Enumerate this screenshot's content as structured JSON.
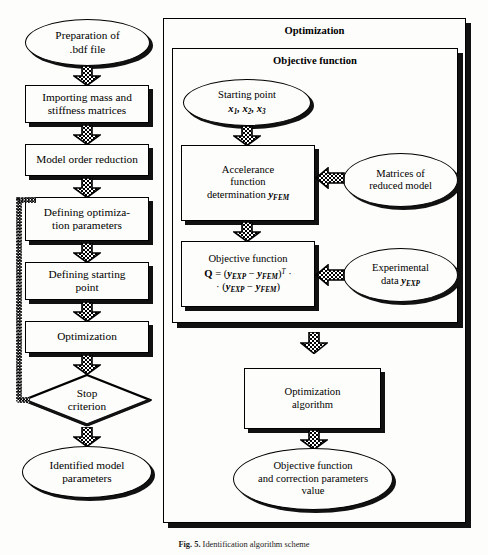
{
  "figure": {
    "caption_label": "Fig. 5.",
    "caption_text": "Identification algorithm scheme"
  },
  "left_column": {
    "nodes": [
      {
        "id": "prep",
        "shape": "ellipse",
        "line1": "Preparation of",
        "line2": ".bdf file"
      },
      {
        "id": "import",
        "shape": "rect",
        "line1": "Importing mass and",
        "line2": "stiffness matrices"
      },
      {
        "id": "reduction",
        "shape": "rect",
        "line1": "Model order reduction",
        "line2": ""
      },
      {
        "id": "defparams",
        "shape": "rect",
        "line1": "Defining optimiza-",
        "line2": "tion parameters"
      },
      {
        "id": "defstart",
        "shape": "rect",
        "line1": "Defining starting",
        "line2": "point"
      },
      {
        "id": "optimization",
        "shape": "rect",
        "line1": "Optimization",
        "line2": ""
      },
      {
        "id": "stop",
        "shape": "diamond",
        "line1": "Stop",
        "line2": "criterion"
      },
      {
        "id": "identified",
        "shape": "ellipse",
        "line1": "Identified model",
        "line2": "parameters"
      }
    ]
  },
  "right_panel": {
    "outer_frame_title": "Optimization",
    "inner_frame_title": "Objective function",
    "starting_point": {
      "line1": "Starting point",
      "vars": [
        "x",
        "1",
        "x",
        "2",
        "x",
        "3"
      ]
    },
    "accelerance": {
      "line1": "Accelerance",
      "line2": "function",
      "line3_pre": "determination ",
      "line3_sym": "y",
      "line3_sub": "FEM"
    },
    "objective": {
      "title": "Objective function",
      "formula_line1": "Q = (yEXP − yFEM)T ·",
      "formula_line2": "· (yEXP − yFEM)",
      "q": "Q",
      "eq": "=",
      "y": "y",
      "exp": "EXP",
      "minus": "−",
      "fem": "FEM",
      "transpose": "T",
      "dot": "·"
    },
    "matrices_ellipse": {
      "line1": "Matrices of",
      "line2": "reduced model"
    },
    "experimental_ellipse": {
      "line1": "Experimental",
      "line2_pre": "data ",
      "line2_sym": "y",
      "line2_sub": "EXP"
    },
    "algorithm_box": {
      "line1": "Optimization",
      "line2": "algorithm"
    },
    "result_ellipse": {
      "line1": "Objective function",
      "line2": "and correction parameters",
      "line3": "value"
    }
  },
  "icons": {
    "down_arrow": "hatched-down-arrow",
    "left_arrow": "hatched-left-arrow",
    "feedback_loop": "dashed-feedback-loop"
  },
  "colors": {
    "ink": "#000000",
    "shadow": "#111111",
    "paper": "#fdfdfb"
  }
}
